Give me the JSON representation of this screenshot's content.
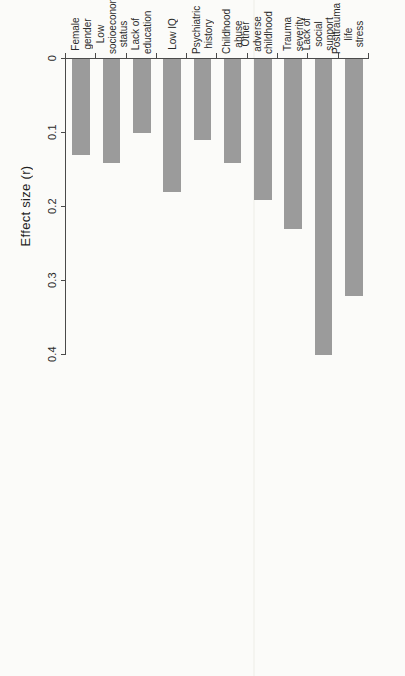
{
  "figure": {
    "axis_title": "Effect size (r)",
    "bar_color": "#9b9b9b",
    "axis_color": "#4a4a4a",
    "background_color": "#fbfbf9"
  },
  "chart_data": {
    "type": "bar",
    "orientation": "horizontal",
    "title": "",
    "xlabel": "Effect size (r)",
    "ylabel": "",
    "xlim": [
      0,
      0.42
    ],
    "grid": false,
    "legend": null,
    "tick_labels": [
      "0",
      "0.1",
      "0.2",
      "0.3",
      "0.4"
    ],
    "tick_values": [
      0,
      0.1,
      0.2,
      0.3,
      0.4
    ],
    "categories": [
      "Female gender",
      "Low socioeconomic status",
      "Lack of education",
      "Low IQ",
      "Psychiatric history",
      "Childhood abuse",
      "Other adverse childhood",
      "Trauma severity",
      "Lack of social support",
      "Posttrauma life stress"
    ],
    "category_lines": [
      [
        "Female",
        "gender"
      ],
      [
        "Low",
        "socioeconomic",
        "status"
      ],
      [
        "Lack of",
        "education"
      ],
      [
        "Low IQ"
      ],
      [
        "Psychiatric",
        "history"
      ],
      [
        "Childhood",
        "abuse"
      ],
      [
        "Other adverse",
        "childhood"
      ],
      [
        "Trauma",
        "severity"
      ],
      [
        "Lack of social",
        "support"
      ],
      [
        "Posttrauma",
        "life stress"
      ]
    ],
    "values": [
      0.13,
      0.14,
      0.1,
      0.18,
      0.11,
      0.14,
      0.19,
      0.23,
      0.4,
      0.32
    ]
  }
}
